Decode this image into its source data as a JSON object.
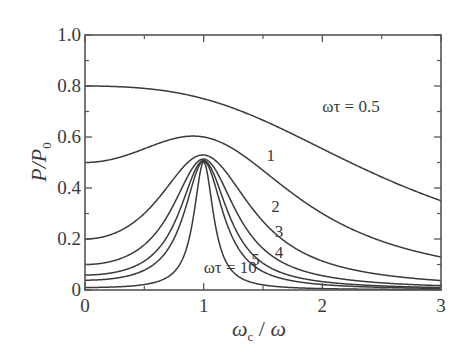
{
  "chart_data": {
    "type": "line",
    "title": "",
    "xlabel": "ωc / ω",
    "ylabel": "P/P0",
    "xlim": [
      0,
      3
    ],
    "ylim": [
      0,
      1.0
    ],
    "grid": false,
    "x_ticks": [
      0,
      1,
      2,
      3
    ],
    "x_tick_labels": [
      "0",
      "1",
      "2",
      "3"
    ],
    "x_minor_ticks": [
      0.5,
      1.5,
      2.5
    ],
    "y_ticks": [
      0,
      0.2,
      0.4,
      0.6,
      0.8,
      1.0
    ],
    "y_tick_labels": [
      "0",
      "0.2",
      "0.4",
      "0.6",
      "0.8",
      "1.0"
    ],
    "y_minor_ticks": [
      0.1,
      0.3,
      0.5,
      0.7,
      0.9
    ],
    "x": [
      0,
      0.25,
      0.5,
      0.75,
      1.0,
      1.25,
      1.5,
      2.0,
      2.5,
      3.0
    ],
    "series": [
      {
        "name": "ωτ = 0.5",
        "omega_tau": 0.5,
        "values": [
          0.8,
          0.8,
          0.79,
          0.77,
          0.75,
          0.71,
          0.67,
          0.55,
          0.44,
          0.35
        ]
      },
      {
        "name": "1",
        "omega_tau": 1,
        "values": [
          0.5,
          0.53,
          0.55,
          0.59,
          0.6,
          0.55,
          0.47,
          0.3,
          0.19,
          0.13
        ]
      },
      {
        "name": "2",
        "omega_tau": 2,
        "values": [
          0.2,
          0.23,
          0.3,
          0.46,
          0.53,
          0.42,
          0.27,
          0.11,
          0.06,
          0.04
        ]
      },
      {
        "name": "3",
        "omega_tau": 3,
        "values": [
          0.1,
          0.12,
          0.19,
          0.39,
          0.51,
          0.35,
          0.16,
          0.05,
          0.03,
          0.02
        ]
      },
      {
        "name": "4",
        "omega_tau": 4,
        "values": [
          0.06,
          0.08,
          0.12,
          0.34,
          0.51,
          0.31,
          0.11,
          0.03,
          0.02,
          0.01
        ]
      },
      {
        "name": "5",
        "omega_tau": 5,
        "values": [
          0.04,
          0.05,
          0.08,
          0.3,
          0.5,
          0.28,
          0.08,
          0.02,
          0.01,
          0.01
        ]
      },
      {
        "name": "ωτ = 10",
        "omega_tau": 10,
        "values": [
          0.01,
          0.01,
          0.02,
          0.14,
          0.5,
          0.14,
          0.02,
          0.01,
          0.0,
          0.0
        ]
      }
    ],
    "annotations": [
      {
        "text": "ωτ = 0.5",
        "x": 2.0,
        "y": 0.72
      },
      {
        "text": "1",
        "x": 1.53,
        "y": 0.53
      },
      {
        "text": "2",
        "x": 1.57,
        "y": 0.33
      },
      {
        "text": "3",
        "x": 1.6,
        "y": 0.23
      },
      {
        "text": "4",
        "x": 1.6,
        "y": 0.15
      },
      {
        "text": "5",
        "x": 1.4,
        "y": 0.12
      },
      {
        "text": "ωτ = 10",
        "x": 1.0,
        "y": 0.09
      }
    ],
    "line_color": "#3a3a3a",
    "formula": "P/P0 = 1/2 [1/(1+(ωτ)^2(1-x)^2) + 1/(1+(ωτ)^2(1+x)^2)]"
  }
}
